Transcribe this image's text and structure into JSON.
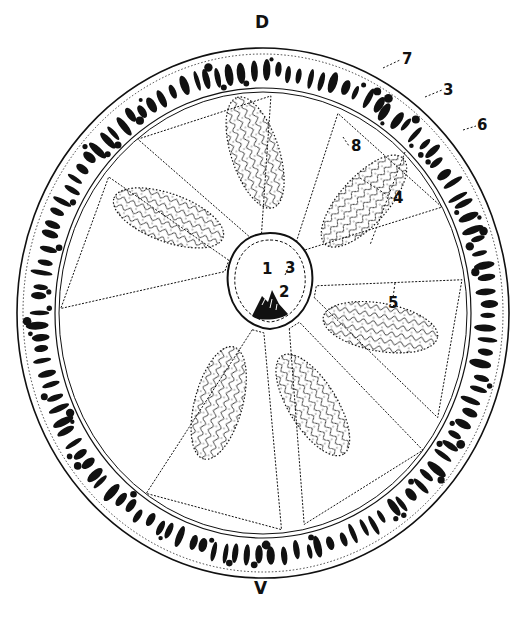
{
  "figure": {
    "kind": "anatomical cross-section illustration",
    "colors": {
      "ink": "#111111",
      "paper": "#ffffff"
    },
    "orientation": {
      "top": "D",
      "bottom": "V"
    },
    "labels": [
      {
        "id": "D",
        "text": "D",
        "x": 255,
        "y": 14
      },
      {
        "id": "V",
        "text": "V",
        "x": 254,
        "y": 580
      },
      {
        "id": "7",
        "text": "7",
        "x": 405,
        "y": 62
      },
      {
        "id": "3a",
        "text": "3",
        "x": 444,
        "y": 93
      },
      {
        "id": "6",
        "text": "6",
        "x": 478,
        "y": 128
      },
      {
        "id": "8",
        "text": "8",
        "x": 351,
        "y": 141
      },
      {
        "id": "4",
        "text": "4",
        "x": 395,
        "y": 200
      },
      {
        "id": "5",
        "text": "5",
        "x": 389,
        "y": 300
      },
      {
        "id": "1",
        "text": "1",
        "x": 263,
        "y": 270
      },
      {
        "id": "3b",
        "text": "3",
        "x": 284,
        "y": 265
      },
      {
        "id": "2",
        "text": "2",
        "x": 279,
        "y": 294
      }
    ],
    "mesentery_count": 6
  }
}
